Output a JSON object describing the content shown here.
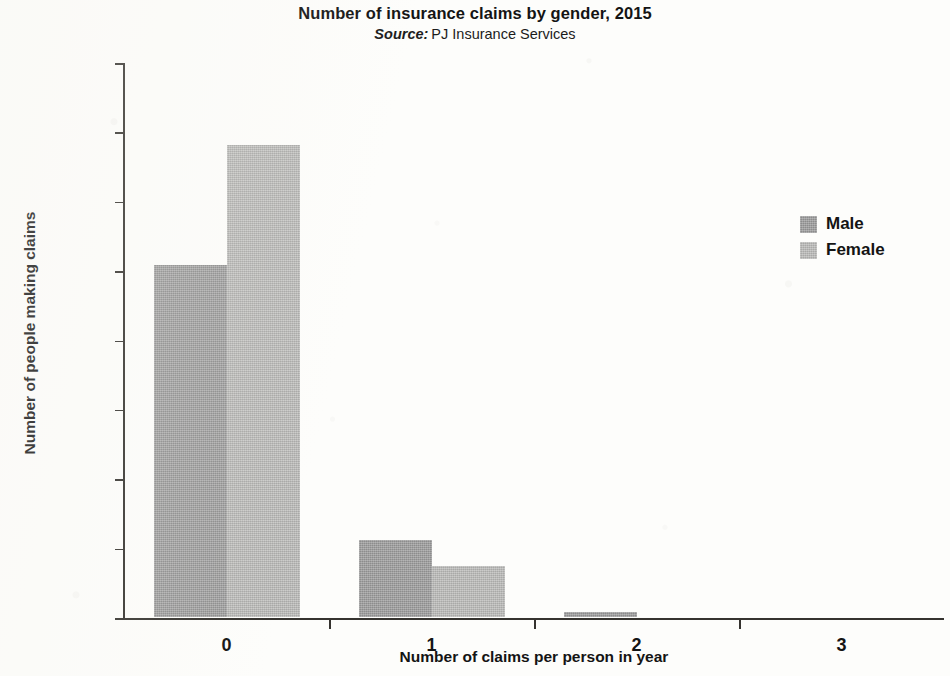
{
  "chart_data": {
    "type": "bar",
    "title": "Number of insurance claims by gender, 2015",
    "subtitle_prefix": "Source:",
    "subtitle_text": "PJ Insurance Services",
    "xlabel": "Number of claims per person in year",
    "ylabel": "Number of people making claims",
    "categories": [
      "0",
      "1",
      "2",
      "3"
    ],
    "series": [
      {
        "name": "Male",
        "color": "#9a9a9a",
        "values": [
          10150,
          2220,
          150,
          0
        ]
      },
      {
        "name": "Female",
        "color": "#b9b9b7",
        "values": [
          13600,
          1470,
          0,
          0
        ]
      }
    ],
    "ylim": [
      0,
      16000
    ],
    "ytick_step": 2000,
    "yticks": [
      "0",
      "2000",
      "4000",
      "6000",
      "8000",
      "10000",
      "12000",
      "14000",
      "16000"
    ],
    "grid": false,
    "legend_position": "right"
  }
}
